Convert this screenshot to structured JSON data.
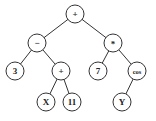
{
  "diagram": {
    "type": "expression-tree",
    "nodes": [
      {
        "id": "n0",
        "label": "+",
        "x": 75,
        "y": 14
      },
      {
        "id": "n1",
        "label": "−",
        "x": 37,
        "y": 43
      },
      {
        "id": "n2",
        "label": "*",
        "x": 113,
        "y": 43
      },
      {
        "id": "n3",
        "label": "3",
        "x": 15,
        "y": 71
      },
      {
        "id": "n4",
        "label": "+",
        "x": 61,
        "y": 71
      },
      {
        "id": "n5",
        "label": "7",
        "x": 98,
        "y": 71
      },
      {
        "id": "n6",
        "label": "cos",
        "x": 137,
        "y": 71
      },
      {
        "id": "n7",
        "label": "X",
        "x": 46,
        "y": 102
      },
      {
        "id": "n8",
        "label": "11",
        "x": 72,
        "y": 102
      },
      {
        "id": "n9",
        "label": "Y",
        "x": 122,
        "y": 102
      }
    ],
    "edges": [
      [
        "n0",
        "n1"
      ],
      [
        "n0",
        "n2"
      ],
      [
        "n1",
        "n3"
      ],
      [
        "n1",
        "n4"
      ],
      [
        "n2",
        "n5"
      ],
      [
        "n2",
        "n6"
      ],
      [
        "n4",
        "n7"
      ],
      [
        "n4",
        "n8"
      ],
      [
        "n6",
        "n9"
      ]
    ],
    "node_radius": 9
  }
}
